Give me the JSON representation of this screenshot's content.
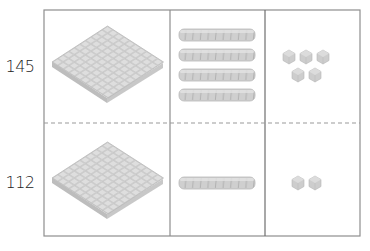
{
  "diagram": {
    "type": "place-value-base-ten-blocks",
    "columns": [
      "hundreds",
      "tens",
      "ones"
    ],
    "colors": {
      "border": "#8a8a8a",
      "divider_dashed": "#9a9a9a",
      "block_fill": "#d4d4d4",
      "block_edge": "#b8b8b8",
      "block_shadow": "#a9a9a9"
    },
    "rows": [
      {
        "number": "145",
        "hundreds": 1,
        "tens": 4,
        "ones": 5
      },
      {
        "number": "112",
        "hundreds": 1,
        "tens": 1,
        "ones": 2
      }
    ]
  }
}
